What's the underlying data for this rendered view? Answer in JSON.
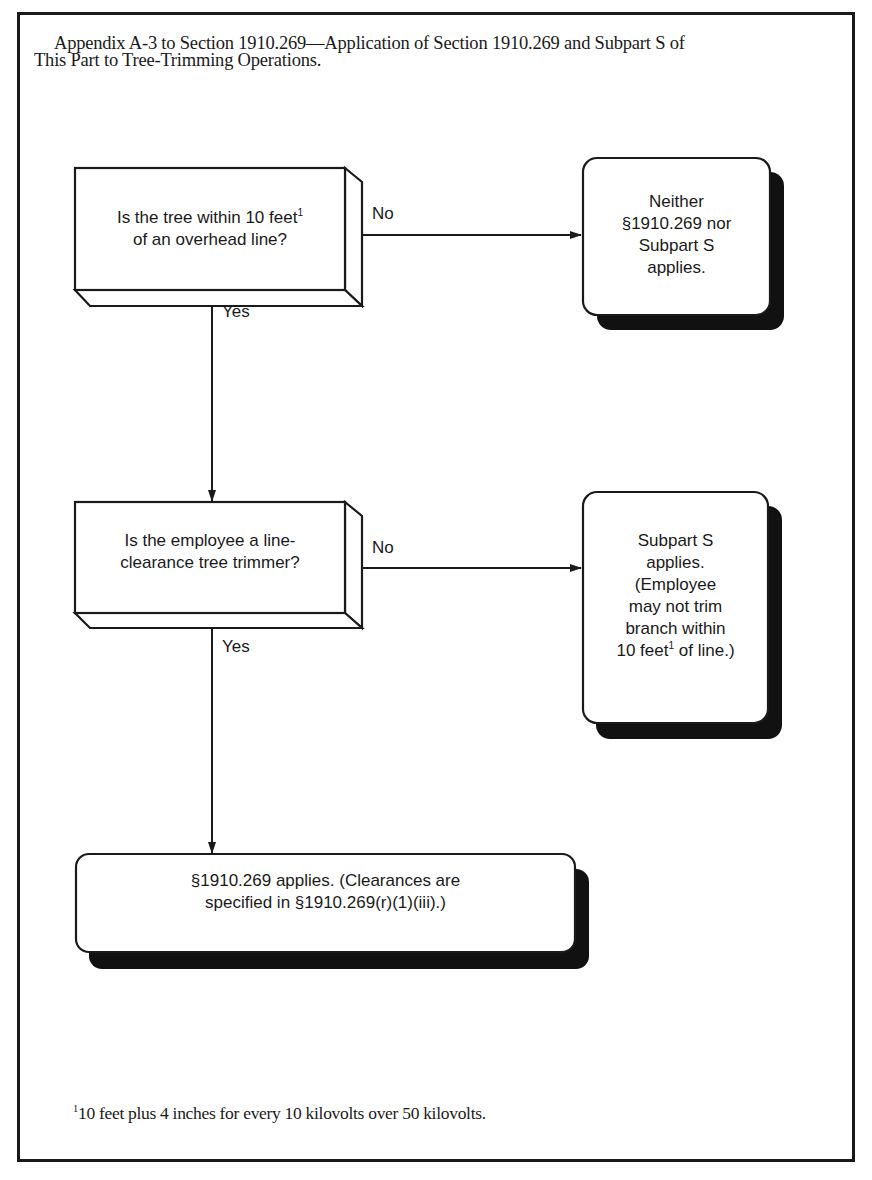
{
  "title": {
    "line1": "Appendix A-3 to Section 1910.269—Application of Section 1910.269 and Subpart S of",
    "line2": "This Part to Tree-Trimming Operations."
  },
  "flowchart": {
    "decisions": [
      {
        "id": "q1",
        "text_before_sup": "Is the tree within 10 feet",
        "sup": "1",
        "text_line2": "of an overhead line?",
        "no_label": "No",
        "yes_label": "Yes"
      },
      {
        "id": "q2",
        "line1": "Is the employee a line-",
        "line2": "clearance tree trimmer?",
        "no_label": "No",
        "yes_label": "Yes"
      }
    ],
    "outcomes": [
      {
        "id": "r1",
        "lines": [
          "Neither",
          "§1910.269 nor",
          "Subpart S",
          "applies."
        ]
      },
      {
        "id": "r2",
        "lines": [
          "Subpart S",
          "applies.",
          "(Employee",
          "may not trim",
          "branch within"
        ],
        "last_line_before_sup": "10 feet",
        "last_line_sup": "1",
        "last_line_after_sup": " of line.)"
      },
      {
        "id": "r3",
        "line1": "§1910.269 applies. (Clearances are",
        "line2": "specified in §1910.269(r)(1)(iii).)"
      }
    ],
    "edges": [
      {
        "from": "q1",
        "to": "r1",
        "label": "No"
      },
      {
        "from": "q1",
        "to": "q2",
        "label": "Yes"
      },
      {
        "from": "q2",
        "to": "r2",
        "label": "No"
      },
      {
        "from": "q2",
        "to": "r3",
        "label": "Yes"
      }
    ]
  },
  "footnote": {
    "marker": "1",
    "text": "10 feet plus 4 inches for every 10 kilovolts over 50 kilovolts."
  },
  "colors": {
    "ink": "#1a1a1a",
    "background": "#ffffff"
  }
}
